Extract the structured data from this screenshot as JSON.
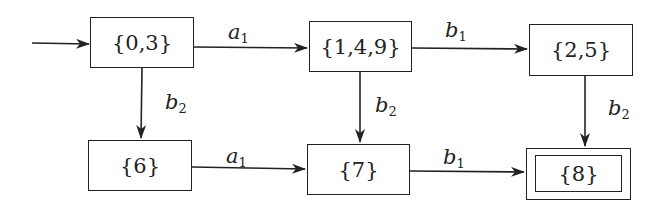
{
  "diagram": {
    "type": "state-transition",
    "nodes": [
      {
        "id": "n03",
        "label": "{0,3}",
        "initial": true,
        "accepting": false
      },
      {
        "id": "n149",
        "label": "{1,4,9}",
        "initial": false,
        "accepting": false
      },
      {
        "id": "n25",
        "label": "{2,5}",
        "initial": false,
        "accepting": false
      },
      {
        "id": "n6",
        "label": "{6}",
        "initial": false,
        "accepting": false
      },
      {
        "id": "n7",
        "label": "{7}",
        "initial": false,
        "accepting": false
      },
      {
        "id": "n8",
        "label": "{8}",
        "initial": false,
        "accepting": true
      }
    ],
    "edges": [
      {
        "from": "n03",
        "to": "n149",
        "sym": "a",
        "sub": "1"
      },
      {
        "from": "n149",
        "to": "n25",
        "sym": "b",
        "sub": "1"
      },
      {
        "from": "n03",
        "to": "n6",
        "sym": "b",
        "sub": "2"
      },
      {
        "from": "n149",
        "to": "n7",
        "sym": "b",
        "sub": "2"
      },
      {
        "from": "n25",
        "to": "n8",
        "sym": "b",
        "sub": "2"
      },
      {
        "from": "n6",
        "to": "n7",
        "sym": "a",
        "sub": "1"
      },
      {
        "from": "n7",
        "to": "n8",
        "sym": "b",
        "sub": "1"
      }
    ]
  }
}
